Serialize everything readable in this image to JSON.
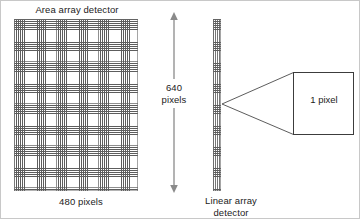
{
  "figure": {
    "area_detector": {
      "title": "Area array detector",
      "width_label": "480 pixels",
      "height_label_line1": "640",
      "height_label_line2": "pixels",
      "columns": 480,
      "rows": 640
    },
    "linear_detector": {
      "label_line1": "Linear array",
      "label_line2": "detector",
      "rows": 640
    },
    "callout": {
      "label": "1 pixel"
    },
    "colors": {
      "grid_line": "#5d5d5d",
      "outline": "#6a6a6a",
      "text": "#222222",
      "background": "#ffffff",
      "arrow": "#808080"
    }
  }
}
